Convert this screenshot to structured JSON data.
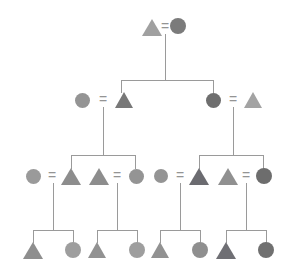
{
  "diagram": {
    "type": "pedigree",
    "width": 286,
    "height": 273,
    "background_color": "#ffffff",
    "line_color": "#9a9a9a",
    "mating_symbol": "=",
    "legend": {
      "triangle_meaning": "male",
      "circle_meaning": "female"
    },
    "palette": {
      "light_gray": "#a8a8a8",
      "medium_gray": "#949494",
      "mid_dark_gray": "#808080",
      "dark_gray": "#6e6e6e",
      "darkest_gray": "#5f6066"
    },
    "generations": [
      {
        "label": "I",
        "y": 27,
        "individuals": [
          {
            "id": "I-1",
            "shape": "triangle",
            "color": "#a0a0a0",
            "size": 17,
            "cx": 152,
            "cy": 27
          },
          {
            "id": "I-2",
            "shape": "circle",
            "color": "#7b7b7b",
            "size": 16,
            "cx": 178,
            "cy": 26
          }
        ],
        "matings": [
          {
            "symbol": "=",
            "x": 165,
            "y": 26
          }
        ]
      },
      {
        "label": "II",
        "y": 100,
        "individuals": [
          {
            "id": "II-1",
            "shape": "circle",
            "color": "#949494",
            "size": 15,
            "cx": 82,
            "cy": 100
          },
          {
            "id": "II-2",
            "shape": "triangle",
            "color": "#787878",
            "size": 16,
            "cx": 124,
            "cy": 100
          },
          {
            "id": "II-3",
            "shape": "circle",
            "color": "#6e6e6e",
            "size": 15,
            "cx": 213,
            "cy": 100
          },
          {
            "id": "II-4",
            "shape": "triangle",
            "color": "#a3a3a3",
            "size": 16,
            "cx": 253,
            "cy": 100
          }
        ],
        "matings": [
          {
            "symbol": "=",
            "x": 103,
            "y": 99
          },
          {
            "symbol": "=",
            "x": 233,
            "y": 99
          }
        ]
      },
      {
        "label": "III",
        "y": 176,
        "individuals": [
          {
            "id": "III-1",
            "shape": "circle",
            "color": "#9a9a9a",
            "size": 15,
            "cx": 33,
            "cy": 176
          },
          {
            "id": "III-2",
            "shape": "triangle",
            "color": "#8d8d8d",
            "size": 17,
            "cx": 71,
            "cy": 176
          },
          {
            "id": "III-3",
            "shape": "triangle",
            "color": "#8d8d8d",
            "size": 17,
            "cx": 99,
            "cy": 176
          },
          {
            "id": "III-4",
            "shape": "circle",
            "color": "#949494",
            "size": 15,
            "cx": 136,
            "cy": 176
          },
          {
            "id": "III-5",
            "shape": "circle",
            "color": "#949494",
            "size": 14,
            "cx": 161,
            "cy": 176
          },
          {
            "id": "III-6",
            "shape": "triangle",
            "color": "#6b6b70",
            "size": 17,
            "cx": 199,
            "cy": 176
          },
          {
            "id": "III-7",
            "shape": "triangle",
            "color": "#909090",
            "size": 17,
            "cx": 228,
            "cy": 176
          },
          {
            "id": "III-8",
            "shape": "circle",
            "color": "#6d6d6d",
            "size": 16,
            "cx": 264,
            "cy": 176
          }
        ],
        "matings": [
          {
            "symbol": "=",
            "x": 52,
            "y": 175
          },
          {
            "symbol": "=",
            "x": 117,
            "y": 175
          },
          {
            "symbol": "=",
            "x": 180,
            "y": 175
          },
          {
            "symbol": "=",
            "x": 246,
            "y": 175
          }
        ]
      },
      {
        "label": "IV",
        "y": 250,
        "individuals": [
          {
            "id": "IV-1",
            "shape": "triangle",
            "color": "#8e8e8e",
            "size": 17,
            "cx": 33,
            "cy": 250
          },
          {
            "id": "IV-2",
            "shape": "circle",
            "color": "#9e9e9e",
            "size": 16,
            "cx": 73,
            "cy": 250
          },
          {
            "id": "IV-3",
            "shape": "triangle",
            "color": "#929292",
            "size": 16,
            "cx": 97,
            "cy": 250
          },
          {
            "id": "IV-4",
            "shape": "circle",
            "color": "#9e9e9e",
            "size": 16,
            "cx": 137,
            "cy": 250
          },
          {
            "id": "IV-5",
            "shape": "triangle",
            "color": "#929292",
            "size": 16,
            "cx": 160,
            "cy": 250
          },
          {
            "id": "IV-6",
            "shape": "circle",
            "color": "#8f8f8f",
            "size": 16,
            "cx": 200,
            "cy": 250
          },
          {
            "id": "IV-7",
            "shape": "triangle",
            "color": "#6f6f74",
            "size": 17,
            "cx": 226,
            "cy": 250
          },
          {
            "id": "IV-8",
            "shape": "circle",
            "color": "#707070",
            "size": 16,
            "cx": 266,
            "cy": 250
          }
        ],
        "matings": []
      }
    ],
    "connectors": [
      {
        "kind": "v",
        "x": 165,
        "y1": 34,
        "y2": 80,
        "note": "drop from gen I couple"
      },
      {
        "kind": "h",
        "x1": 121,
        "x2": 213,
        "y": 80,
        "note": "gen II sibship bar"
      },
      {
        "kind": "v",
        "x": 121,
        "y1": 80,
        "y2": 93,
        "note": "to II-2"
      },
      {
        "kind": "v",
        "x": 213,
        "y1": 80,
        "y2": 93,
        "note": "to II-3"
      },
      {
        "kind": "v",
        "x": 103,
        "y1": 107,
        "y2": 155,
        "note": "drop from gen II left couple"
      },
      {
        "kind": "h",
        "x1": 71,
        "x2": 135,
        "y": 155,
        "note": "gen III left sibship bar"
      },
      {
        "kind": "v",
        "x": 71,
        "y1": 155,
        "y2": 169,
        "note": "to III-2"
      },
      {
        "kind": "v",
        "x": 135,
        "y1": 155,
        "y2": 169,
        "note": "to III-4"
      },
      {
        "kind": "v",
        "x": 233,
        "y1": 107,
        "y2": 155,
        "note": "drop from gen II right couple"
      },
      {
        "kind": "h",
        "x1": 199,
        "x2": 263,
        "y": 155,
        "note": "gen III right sibship bar"
      },
      {
        "kind": "v",
        "x": 199,
        "y1": 155,
        "y2": 169,
        "note": "to III-6"
      },
      {
        "kind": "v",
        "x": 263,
        "y1": 155,
        "y2": 169,
        "note": "to III-8"
      },
      {
        "kind": "v",
        "x": 53,
        "y1": 183,
        "y2": 230,
        "note": "drop from III-1 x III-2"
      },
      {
        "kind": "h",
        "x1": 33,
        "x2": 73,
        "y": 230,
        "note": "gen IV sibship bar 1"
      },
      {
        "kind": "v",
        "x": 33,
        "y1": 230,
        "y2": 243,
        "note": "to IV-1"
      },
      {
        "kind": "v",
        "x": 73,
        "y1": 230,
        "y2": 243,
        "note": "to IV-2"
      },
      {
        "kind": "v",
        "x": 117,
        "y1": 183,
        "y2": 230,
        "note": "drop from III-3 x III-4"
      },
      {
        "kind": "h",
        "x1": 97,
        "x2": 137,
        "y": 230,
        "note": "gen IV sibship bar 2"
      },
      {
        "kind": "v",
        "x": 97,
        "y1": 230,
        "y2": 243,
        "note": "to IV-3"
      },
      {
        "kind": "v",
        "x": 137,
        "y1": 230,
        "y2": 243,
        "note": "to IV-4"
      },
      {
        "kind": "v",
        "x": 180,
        "y1": 183,
        "y2": 230,
        "note": "drop from III-5 x III-6"
      },
      {
        "kind": "h",
        "x1": 160,
        "x2": 200,
        "y": 230,
        "note": "gen IV sibship bar 3"
      },
      {
        "kind": "v",
        "x": 160,
        "y1": 230,
        "y2": 243,
        "note": "to IV-5"
      },
      {
        "kind": "v",
        "x": 200,
        "y1": 230,
        "y2": 243,
        "note": "to IV-6"
      },
      {
        "kind": "v",
        "x": 246,
        "y1": 183,
        "y2": 230,
        "note": "drop from III-7 x III-8"
      },
      {
        "kind": "h",
        "x1": 226,
        "x2": 266,
        "y": 230,
        "note": "gen IV sibship bar 4"
      },
      {
        "kind": "v",
        "x": 226,
        "y1": 230,
        "y2": 243,
        "note": "to IV-7"
      },
      {
        "kind": "v",
        "x": 266,
        "y1": 230,
        "y2": 243,
        "note": "to IV-8"
      }
    ]
  }
}
